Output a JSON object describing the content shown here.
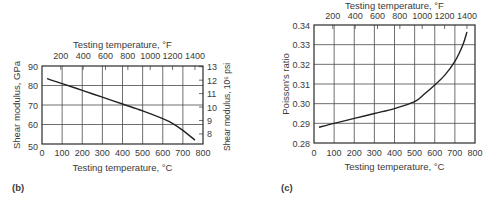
{
  "chart_data": [
    {
      "panel_label": "(b)",
      "type": "line",
      "title": "",
      "xlabel": "Testing temperature, °C",
      "x2label": "Testing temperature, °F",
      "ylabel": "Shear modulus, GPa",
      "y2label": "Shear modulus, 10⁶ psi",
      "xlim": [
        0,
        800
      ],
      "ylim": [
        50,
        90
      ],
      "x_ticks": [
        "0",
        "100",
        "200",
        "300",
        "400",
        "500",
        "600",
        "700",
        "800"
      ],
      "x2_ticks": [
        "200",
        "400",
        "600",
        "800",
        "1000",
        "1200",
        "1400"
      ],
      "y_ticks": [
        "50",
        "60",
        "70",
        "80",
        "90"
      ],
      "y2_ticks": [
        "8",
        "9",
        "10",
        "11",
        "12",
        "13"
      ],
      "grid": true,
      "series": [
        {
          "name": "Shear modulus",
          "x": [
            25,
            100,
            200,
            300,
            400,
            500,
            600,
            650,
            700,
            760
          ],
          "y": [
            83.5,
            81,
            77.5,
            74,
            70.5,
            67,
            63,
            60.5,
            57,
            52
          ]
        }
      ]
    },
    {
      "panel_label": "(c)",
      "type": "line",
      "title": "",
      "xlabel": "Testing temperature, °C",
      "x2label": "Testing temperature, °F",
      "ylabel": "Poisson's ratio",
      "xlim": [
        0,
        800
      ],
      "ylim": [
        0.28,
        0.34
      ],
      "x_ticks": [
        "0",
        "100",
        "200",
        "300",
        "400",
        "500",
        "600",
        "700",
        "800"
      ],
      "x2_ticks": [
        "200",
        "400",
        "600",
        "800",
        "1000",
        "1200",
        "1400"
      ],
      "y_ticks": [
        "0.28",
        "0.29",
        "0.30",
        "0.31",
        "0.32",
        "0.33",
        "0.34"
      ],
      "grid": true,
      "series": [
        {
          "name": "Poisson's ratio",
          "x": [
            25,
            100,
            200,
            300,
            400,
            500,
            550,
            600,
            650,
            700,
            740,
            760
          ],
          "y": [
            0.288,
            0.29,
            0.2925,
            0.295,
            0.2975,
            0.301,
            0.305,
            0.3095,
            0.3145,
            0.3215,
            0.33,
            0.3365
          ]
        }
      ]
    }
  ]
}
